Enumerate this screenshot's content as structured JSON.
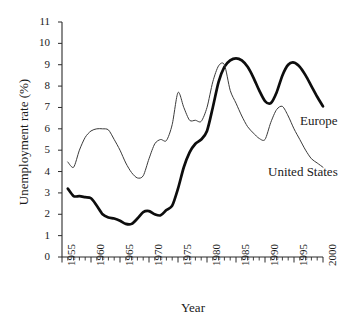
{
  "chart_data": {
    "type": "line",
    "title": "",
    "xlabel": "Year",
    "ylabel": "Unemployment rate (%)",
    "xlim": [
      1955,
      2000
    ],
    "ylim": [
      0,
      11
    ],
    "y_ticks": [
      0,
      1,
      2,
      3,
      4,
      5,
      6,
      7,
      8,
      9,
      10,
      11
    ],
    "x_ticks_major": [
      1955,
      1960,
      1965,
      1970,
      1975,
      1980,
      1985,
      1990,
      1995,
      2000
    ],
    "x_tick_minor_step": 1,
    "grid": false,
    "legend_position": "inline-right-annotations",
    "series": [
      {
        "name": "Europe",
        "style": "thick-black",
        "color": "#0d0d0d",
        "x": [
          1956,
          1957,
          1958,
          1959,
          1960,
          1961,
          1962,
          1963,
          1964,
          1965,
          1966,
          1967,
          1968,
          1969,
          1970,
          1971,
          1972,
          1973,
          1974,
          1975,
          1976,
          1977,
          1978,
          1979,
          1980,
          1981,
          1982,
          1983,
          1984,
          1985,
          1986,
          1987,
          1988,
          1989,
          1990,
          1991,
          1992,
          1993,
          1994,
          1995,
          1996,
          1997,
          1998,
          1999,
          2000
        ],
        "values": [
          3.2,
          2.85,
          2.85,
          2.8,
          2.75,
          2.4,
          2.0,
          1.85,
          1.8,
          1.7,
          1.55,
          1.55,
          1.8,
          2.1,
          2.15,
          2.0,
          1.95,
          2.2,
          2.4,
          3.2,
          4.2,
          4.9,
          5.3,
          5.5,
          5.9,
          7.0,
          8.2,
          8.9,
          9.2,
          9.3,
          9.2,
          8.9,
          8.4,
          7.8,
          7.3,
          7.2,
          7.7,
          8.5,
          9.0,
          9.1,
          8.9,
          8.5,
          8.0,
          7.5,
          7.05
        ]
      },
      {
        "name": "United States",
        "style": "thin-black",
        "color": "#3a3a3a",
        "x": [
          1956,
          1957,
          1958,
          1959,
          1960,
          1961,
          1962,
          1963,
          1964,
          1965,
          1966,
          1967,
          1968,
          1969,
          1970,
          1971,
          1972,
          1973,
          1974,
          1975,
          1976,
          1977,
          1978,
          1979,
          1980,
          1981,
          1982,
          1983,
          1984,
          1985,
          1986,
          1987,
          1988,
          1989,
          1990,
          1991,
          1992,
          1993,
          1994,
          1995,
          1996,
          1997,
          1998,
          1999,
          2000
        ],
        "values": [
          4.45,
          4.2,
          5.0,
          5.6,
          5.9,
          6.0,
          6.0,
          5.95,
          5.5,
          5.0,
          4.4,
          3.95,
          3.7,
          3.8,
          4.6,
          5.3,
          5.5,
          5.45,
          6.2,
          7.7,
          7.0,
          6.4,
          6.4,
          6.35,
          7.0,
          8.2,
          8.95,
          9.0,
          7.8,
          7.2,
          6.6,
          6.1,
          5.8,
          5.55,
          5.5,
          6.3,
          6.9,
          7.05,
          6.6,
          6.0,
          5.5,
          5.0,
          4.6,
          4.4,
          4.2
        ]
      }
    ],
    "annotations": [
      {
        "text": "Europe",
        "series": "Europe"
      },
      {
        "text": "United States",
        "series": "United States"
      }
    ]
  },
  "axes": {
    "y_title": "Unemployment rate (%)",
    "x_title": "Year",
    "y_tick_labels": [
      "0",
      "1",
      "2",
      "3",
      "4",
      "5",
      "6",
      "7",
      "8",
      "9",
      "10",
      "11"
    ],
    "x_tick_labels": [
      "1955",
      "1960",
      "1965",
      "1970",
      "1975",
      "1980",
      "1985",
      "1990",
      "1995",
      "2000"
    ]
  },
  "annotations": {
    "europe_label": "Europe",
    "united_states_label": "United States"
  },
  "colors": {
    "europe": "#0d0d0d",
    "united_states": "#3a3a3a",
    "axis": "#2b2b2b",
    "background": "#ffffff"
  }
}
